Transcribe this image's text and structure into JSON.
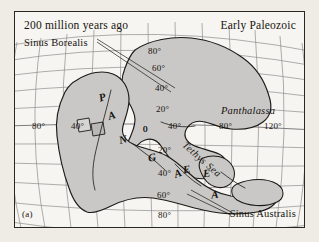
{
  "figure": {
    "tag": "(a)",
    "title_left": "200 million years ago",
    "title_right": "Early Paleozoic"
  },
  "colors": {
    "page_background": "#efece6",
    "map_background": "#f7f5f1",
    "land_fill": "#c9c8c6",
    "coastline": "#1c1a17",
    "graticule": "#8d8d8d",
    "border": "#2a2722",
    "text": "#16130f"
  },
  "map": {
    "projection": "curved-global-graticule",
    "seas": [
      {
        "name": "Sinus Borealis",
        "style": "roman",
        "position": "upper-left",
        "has_leader_line": true
      },
      {
        "name": "Sinus Australis",
        "style": "roman",
        "position": "lower-right",
        "has_leader_line": true
      },
      {
        "name": "Panthalassa",
        "style": "italic",
        "position": "right-of-equator",
        "has_leader_line": false
      },
      {
        "name": "Tethys Sea",
        "style": "italic-rotated",
        "position": "center-right",
        "has_leader_line": false
      }
    ],
    "supercontinent": {
      "name": "PANGEA",
      "letters": [
        "P",
        "A",
        "N",
        "G",
        "E",
        "A"
      ]
    },
    "latitude_labels": [
      "80°",
      "60°",
      "40°",
      "20°",
      "0",
      "20°",
      "40°",
      "60°",
      "80°"
    ],
    "longitude_labels": [
      "80°",
      "40°",
      "0",
      "40°",
      "80°",
      "120°"
    ],
    "graticule_interval_degrees": 20
  }
}
